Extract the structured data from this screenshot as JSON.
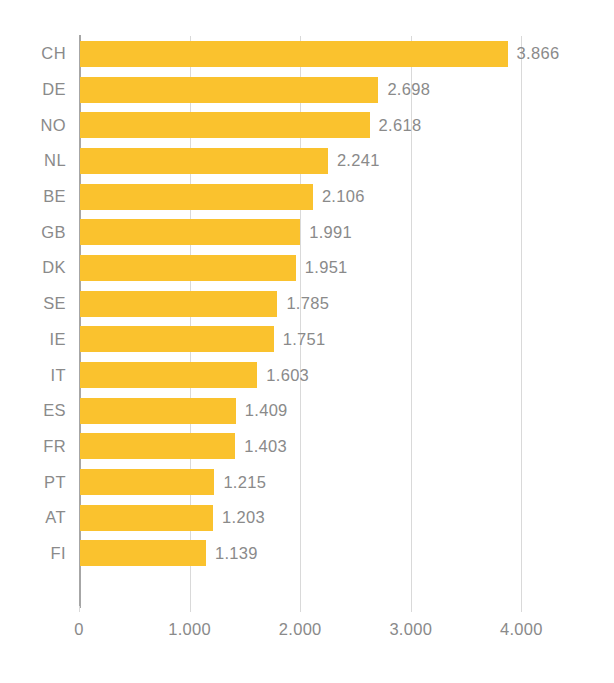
{
  "chart_data": {
    "type": "bar",
    "orientation": "horizontal",
    "title": "",
    "subtitle": "",
    "xlabel": "",
    "ylabel": "",
    "categories": [
      "CH",
      "DE",
      "NO",
      "NL",
      "BE",
      "GB",
      "DK",
      "SE",
      "IE",
      "IT",
      "ES",
      "FR",
      "PT",
      "AT",
      "FI"
    ],
    "values": [
      3866,
      2698,
      2618,
      2241,
      2106,
      1991,
      1951,
      1785,
      1751,
      1603,
      1409,
      1403,
      1215,
      1203,
      1139
    ],
    "value_labels": [
      "3.866",
      "2.698",
      "2.618",
      "2.241",
      "2.106",
      "1.991",
      "1.951",
      "1.785",
      "1.751",
      "1.603",
      "1.409",
      "1.403",
      "1.215",
      "1.203",
      "1.139"
    ],
    "xlim": [
      0,
      4400
    ],
    "xticks": [
      0,
      1000,
      2000,
      3000,
      4000
    ],
    "xtick_labels": [
      "0",
      "1.000",
      "2.000",
      "3.000",
      "4.000"
    ],
    "grid": true,
    "grid_axis": "x",
    "legend": false,
    "legend_position": "none",
    "bar_color": "#fac22e",
    "text_color": "#8a8a8a",
    "gridline_color": "#d9d9d9",
    "axis_color": "#a6a6a6",
    "background_color": "#ffffff",
    "number_format": "european-thousands-separator-period",
    "data_labels_shown": true,
    "sorted": "descending"
  }
}
